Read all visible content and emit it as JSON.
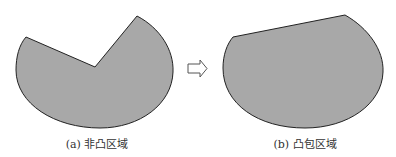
{
  "figure": {
    "panels": [
      {
        "id": "a",
        "caption": "(a) 非凸区域",
        "shape": "non-convex region: circular sector-like blob with a notch cut in from upper-left",
        "fill": "#a8a8a8",
        "stroke": "#222222"
      },
      {
        "id": "b",
        "caption": "(b) 凸包区域",
        "shape": "convex hull region: notch replaced by straight top edge",
        "fill": "#a8a8a8",
        "stroke": "#222222"
      }
    ],
    "arrow": {
      "icon": "hollow-right-arrow",
      "meaning": "transforms into"
    }
  }
}
